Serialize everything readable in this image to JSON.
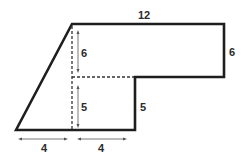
{
  "diagram": {
    "colors": {
      "stroke": "#1e1e1e",
      "dash": "#333333",
      "text": "#2b2b2b",
      "background": "#ffffff"
    },
    "labels": {
      "top_width": "12",
      "right_height": "6",
      "inner_upper_height": "6",
      "inner_lower_height": "5",
      "step_height": "5",
      "bottom_left_width": "4",
      "bottom_right_width": "4"
    }
  }
}
